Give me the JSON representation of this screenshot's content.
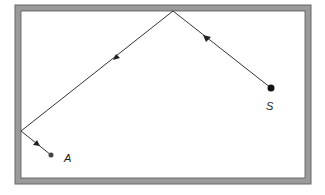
{
  "diagram": {
    "type": "reflection-path",
    "frame": {
      "outer": [
        15,
        5,
        311,
        184
      ],
      "inner": [
        21,
        11,
        305,
        178
      ],
      "wall_color": "#9a9a9a",
      "edge_color": "#555555"
    },
    "points": {
      "source": {
        "label": "S",
        "x": 271,
        "y": 88
      },
      "reflection_top": {
        "x": 173,
        "y": 11
      },
      "reflection_left": {
        "x": 21,
        "y": 131
      },
      "target": {
        "label": "A",
        "x": 51,
        "y": 155
      }
    },
    "labels": {
      "source": "S",
      "target": "A"
    },
    "arrows": [
      {
        "segment": "S-to-top",
        "x": 207,
        "y": 39,
        "direction": "up-left"
      },
      {
        "segment": "top-to-left",
        "x": 116,
        "y": 57,
        "direction": "down-left"
      },
      {
        "segment": "left-to-A",
        "x": 36,
        "y": 143,
        "direction": "down-right"
      }
    ]
  }
}
